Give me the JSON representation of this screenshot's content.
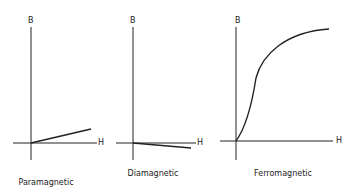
{
  "panels": [
    {
      "id": "paramagnetic",
      "caption": "Paramagnetic",
      "y_label": "B",
      "x_label": "H",
      "curve": "linear-positive-slope"
    },
    {
      "id": "diamagnetic",
      "caption": "Diamagnetic",
      "y_label": "B",
      "x_label": "H",
      "curve": "linear-negative-slope"
    },
    {
      "id": "ferromagnetic",
      "caption": "Ferromagnetic",
      "y_label": "B",
      "x_label": "H",
      "curve": "sigmoid-saturation"
    }
  ],
  "colors": {
    "line": "#222222",
    "background": "#ffffff"
  }
}
